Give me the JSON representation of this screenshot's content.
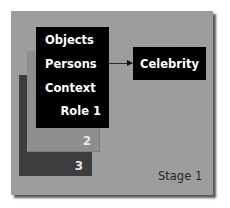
{
  "diagram": {
    "stage_label": "Stage 1",
    "role_stack": {
      "front": {
        "items": [
          "Objects",
          "Persons",
          "Context"
        ],
        "role_label": "Role 1"
      },
      "middle_label": "2",
      "back_label": "3"
    },
    "target": "Celebrity",
    "edge": {
      "from": "Persons",
      "to": "Celebrity",
      "type": "arrow"
    },
    "colors": {
      "panel": "#9d9d9d",
      "front_box": "#000000",
      "middle_box": "#8e8e8e",
      "back_box": "#3d3d3d",
      "text_on_dark": "#ffffff"
    }
  }
}
